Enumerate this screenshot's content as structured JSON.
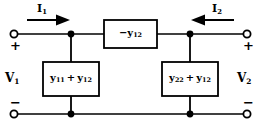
{
  "figure": {
    "type": "two-port-pi-equivalent-circuit",
    "background_color": "#ffffff",
    "line_color": "#000000"
  },
  "currents": {
    "left": {
      "symbol": "I",
      "subscript": "1",
      "direction": "right-arrow-into-port"
    },
    "right": {
      "symbol": "I",
      "subscript": "2",
      "direction": "left-arrow-into-port"
    }
  },
  "voltages": {
    "left": {
      "symbol": "V",
      "subscript": "1",
      "plus": "+",
      "minus": "−"
    },
    "right": {
      "symbol": "V",
      "subscript": "2",
      "plus": "+",
      "minus": "−"
    }
  },
  "elements": {
    "series": {
      "sign": "−",
      "symbol": "y",
      "subscript": "12",
      "position": "top-branch-center"
    },
    "shunt_left": {
      "term1_symbol": "y",
      "term1_subscript": "11",
      "operator": "+",
      "term2_symbol": "y",
      "term2_subscript": "12"
    },
    "shunt_right": {
      "term1_symbol": "y",
      "term1_subscript": "22",
      "operator": "+",
      "term2_symbol": "y",
      "term2_subscript": "12"
    }
  },
  "terminals": {
    "top_left": "open-circle",
    "bottom_left": "open-circle",
    "top_right": "open-circle",
    "bottom_right": "open-circle"
  },
  "junctions": {
    "top_left": "filled-dot",
    "top_right": "filled-dot",
    "bottom_left": "filled-dot",
    "bottom_right": "filled-dot"
  }
}
